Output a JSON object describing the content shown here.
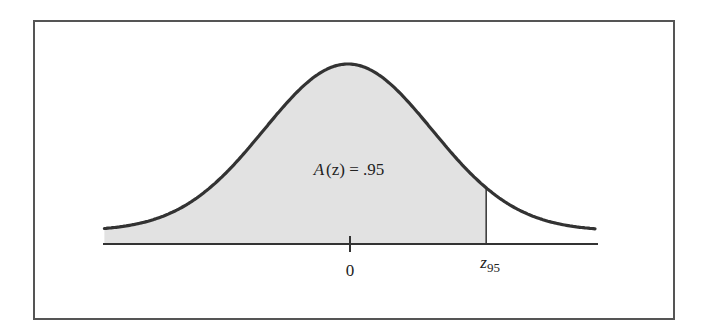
{
  "chart_data": {
    "type": "area",
    "title": "",
    "xlabel": "",
    "ylabel": "",
    "distribution": {
      "name": "standard normal",
      "mean": 0,
      "sd": 1
    },
    "x_range": [
      -2.9,
      2.95
    ],
    "shaded_region": {
      "from": -2.9,
      "to": 1.645,
      "area": 0.95
    },
    "ticks": [
      {
        "x": 0,
        "label": "0"
      }
    ],
    "markers": [
      {
        "x": 1.645,
        "label_main": "z",
        "label_sub": "95"
      }
    ],
    "annotation": {
      "text_prefix": "A",
      "text_arg": "(z)",
      "text_rest": " = .95",
      "x": 0,
      "y_frac": 0.37
    },
    "grid": false,
    "legend": null
  },
  "colors": {
    "curve": "#333333",
    "fill": "#e2e2e2",
    "axis": "#333333",
    "frame": "#555555"
  },
  "labels": {
    "zero": "0",
    "z95_main": "z",
    "z95_sub": "95",
    "area_a": "A",
    "area_z": "(z)",
    "area_eq": " = .95"
  }
}
